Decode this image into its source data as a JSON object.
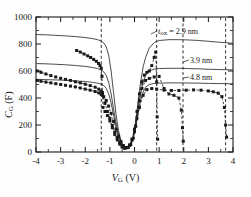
{
  "figure": {
    "kind": "cv-characteristic-plot",
    "background": "#ffffff",
    "frame_color": "#1a1a1a"
  },
  "axes": {
    "x": {
      "label_main": "V",
      "label_sub": "G",
      "label_unit": " (V)",
      "label_full": "V_G (V)",
      "min": -4,
      "max": 4,
      "major_ticks": [
        -4,
        -3,
        -2,
        -1,
        0,
        1,
        2,
        3,
        4
      ],
      "tick_labels": [
        "-4",
        "-3",
        "-2",
        "-1",
        "0",
        "1",
        "2",
        "3",
        "4"
      ],
      "minor_per_major": 2
    },
    "y": {
      "label_main": "C",
      "label_sub": "G",
      "label_unit": " (F)",
      "label_full": "C_G (F)",
      "min": 0,
      "max": 1000,
      "major_ticks": [
        0,
        200,
        400,
        600,
        800,
        1000
      ],
      "tick_labels": [
        "0",
        "200",
        "400",
        "600",
        "800",
        "1000"
      ],
      "minor_per_major": 2
    }
  },
  "annotations": [
    {
      "id": "tox-2-9",
      "text": "t",
      "sub": "ox",
      "eq": " = 2.9 nm",
      "value": 2.9,
      "unit": "nm",
      "full": "t_ox = 2.9 nm"
    },
    {
      "id": "tox-3-9",
      "text": "3.9 nm",
      "value": 3.9,
      "unit": "nm",
      "full": "3.9 nm"
    },
    {
      "id": "tox-4-8",
      "text": "4.8 nm",
      "value": 4.8,
      "unit": "nm",
      "full": "4.8 nm"
    }
  ],
  "chart_data": {
    "type": "line",
    "title": "",
    "xlabel": "V_G (V)",
    "ylabel": "C_G (F)",
    "xlim": [
      -4,
      4
    ],
    "ylim": [
      0,
      1000
    ],
    "grid": false,
    "legend_position": "inside-upper-right-annotations",
    "series": [
      {
        "name": "t_ox = 2.9 nm (model)",
        "style": "solid-line",
        "color": "#2b2b2b",
        "x": [
          -4.0,
          -3.6,
          -3.2,
          -2.8,
          -2.4,
          -2.0,
          -1.7,
          -1.5,
          -1.35,
          -1.25,
          -1.15,
          -1.05,
          -0.95,
          -0.85,
          -0.75,
          -0.65,
          -0.55,
          -0.45,
          -0.35,
          -0.25,
          -0.15,
          -0.05,
          0.05,
          0.15,
          0.25,
          0.35,
          0.45,
          0.6,
          0.8,
          1.0,
          1.4,
          1.8,
          2.2,
          2.6,
          3.0,
          3.4,
          3.8,
          4.0
        ],
        "y": [
          870,
          868,
          864,
          860,
          855,
          848,
          840,
          832,
          822,
          808,
          780,
          720,
          600,
          440,
          280,
          160,
          85,
          45,
          30,
          35,
          60,
          120,
          230,
          380,
          520,
          630,
          700,
          770,
          810,
          826,
          832,
          832,
          830,
          826,
          820,
          814,
          808,
          805
        ]
      },
      {
        "name": "t_ox = 3.9 nm (model)",
        "style": "solid-line",
        "color": "#2b2b2b",
        "x": [
          -4.0,
          -3.6,
          -3.2,
          -2.8,
          -2.4,
          -2.0,
          -1.7,
          -1.5,
          -1.35,
          -1.25,
          -1.15,
          -1.05,
          -0.95,
          -0.85,
          -0.75,
          -0.65,
          -0.55,
          -0.45,
          -0.35,
          -0.25,
          -0.15,
          -0.05,
          0.05,
          0.15,
          0.25,
          0.35,
          0.45,
          0.6,
          0.8,
          1.0,
          1.4,
          1.8,
          2.2,
          2.6,
          3.0,
          3.4,
          3.8,
          4.0
        ],
        "y": [
          655,
          653,
          650,
          646,
          641,
          634,
          626,
          618,
          608,
          594,
          568,
          516,
          430,
          320,
          215,
          132,
          74,
          42,
          30,
          35,
          58,
          112,
          205,
          330,
          440,
          520,
          566,
          600,
          614,
          618,
          620,
          620,
          618,
          616,
          613,
          611,
          609,
          608
        ]
      },
      {
        "name": "t_ox = 4.8 nm (model)",
        "style": "solid-line",
        "color": "#2b2b2b",
        "x": [
          -4.0,
          -3.6,
          -3.2,
          -2.8,
          -2.4,
          -2.0,
          -1.7,
          -1.5,
          -1.35,
          -1.25,
          -1.15,
          -1.05,
          -0.95,
          -0.85,
          -0.75,
          -0.65,
          -0.55,
          -0.45,
          -0.35,
          -0.25,
          -0.15,
          -0.05,
          0.05,
          0.15,
          0.25,
          0.35,
          0.45,
          0.6,
          0.8,
          1.0,
          1.4,
          1.8,
          2.2,
          2.6,
          3.0,
          3.4,
          3.8,
          4.0
        ],
        "y": [
          538,
          536,
          534,
          531,
          527,
          522,
          516,
          510,
          503,
          492,
          472,
          432,
          364,
          274,
          188,
          116,
          66,
          38,
          28,
          33,
          54,
          102,
          184,
          292,
          384,
          444,
          480,
          500,
          508,
          510,
          512,
          512,
          511,
          510,
          508,
          507,
          506,
          505
        ]
      },
      {
        "name": "measured t_ox = 2.9 nm",
        "style": "markers-dashed",
        "marker": "square",
        "color": "#1a1a1a",
        "x": [
          -2.35,
          -2.2,
          -2.05,
          -1.9,
          -1.78,
          -1.66,
          -1.55,
          -1.46,
          -1.4,
          -1.35,
          -1.32,
          -1.3,
          -1.28,
          -1.2,
          -1.1,
          -1.0,
          -0.9,
          -0.8,
          -0.7,
          -0.6,
          -0.5,
          -0.4,
          -0.3,
          -0.2,
          -0.1,
          0.0,
          0.1,
          0.2,
          0.3,
          0.4,
          0.5,
          0.6,
          0.7,
          0.8,
          0.86,
          0.9,
          0.92,
          0.94
        ],
        "y": [
          752,
          740,
          726,
          712,
          700,
          686,
          672,
          656,
          640,
          620,
          560,
          440,
          330,
          300,
          270,
          230,
          180,
          130,
          90,
          58,
          36,
          28,
          34,
          52,
          96,
          170,
          300,
          430,
          520,
          570,
          590,
          600,
          640,
          700,
          740,
          520,
          260,
          95
        ]
      },
      {
        "name": "measured t_ox = 3.9 nm",
        "style": "markers-dashed",
        "marker": "square",
        "color": "#1a1a1a",
        "x": [
          -3.95,
          -3.8,
          -3.6,
          -3.4,
          -3.2,
          -3.0,
          -2.8,
          -2.6,
          -2.4,
          -2.2,
          -2.0,
          -1.8,
          -1.6,
          -1.45,
          -1.35,
          -1.3,
          -1.2,
          -1.1,
          -1.0,
          -0.9,
          -0.8,
          -0.7,
          -0.6,
          -0.5,
          -0.4,
          -0.3,
          -0.2,
          -0.1,
          0.0,
          0.1,
          0.2,
          0.3,
          0.45,
          0.6,
          0.8,
          1.0,
          1.2,
          1.4,
          1.6,
          1.8,
          1.9,
          1.95,
          1.98
        ],
        "y": [
          600,
          590,
          578,
          566,
          556,
          546,
          538,
          530,
          520,
          512,
          502,
          492,
          480,
          466,
          450,
          420,
          360,
          300,
          250,
          196,
          146,
          104,
          70,
          44,
          30,
          32,
          50,
          88,
          150,
          250,
          380,
          470,
          530,
          545,
          556,
          560,
          470,
          430,
          420,
          400,
          310,
          180,
          80
        ]
      },
      {
        "name": "measured t_ox = 4.8 nm",
        "style": "markers-dashed",
        "marker": "square",
        "color": "#1a1a1a",
        "x": [
          -3.95,
          -3.8,
          -3.6,
          -3.4,
          -3.2,
          -3.0,
          -2.8,
          -2.6,
          -2.4,
          -2.2,
          -2.0,
          -1.8,
          -1.6,
          -1.45,
          -1.35,
          -1.25,
          -1.15,
          -1.05,
          -0.95,
          -0.85,
          -0.75,
          -0.65,
          -0.55,
          -0.45,
          -0.35,
          -0.25,
          -0.15,
          -0.05,
          0.05,
          0.2,
          0.35,
          0.5,
          0.7,
          0.9,
          1.2,
          1.5,
          1.8,
          2.1,
          2.4,
          2.7,
          3.0,
          3.2,
          3.4,
          3.55,
          3.65,
          3.7,
          3.74
        ],
        "y": [
          530,
          524,
          518,
          512,
          506,
          500,
          494,
          488,
          482,
          474,
          466,
          458,
          448,
          438,
          426,
          410,
          382,
          340,
          286,
          226,
          168,
          118,
          78,
          48,
          32,
          34,
          54,
          102,
          190,
          330,
          420,
          462,
          470,
          466,
          458,
          456,
          456,
          458,
          460,
          458,
          452,
          446,
          436,
          410,
          330,
          200,
          110
        ]
      }
    ],
    "breakdown_lines": [
      {
        "name": "breakdown-left",
        "x": -1.35,
        "style": "dashed"
      },
      {
        "name": "breakdown-2-9nm",
        "x": 0.9,
        "style": "dashed"
      },
      {
        "name": "breakdown-3-9nm",
        "x": 1.97,
        "style": "dashed"
      },
      {
        "name": "breakdown-4-8nm",
        "x": 3.7,
        "style": "dashed"
      }
    ]
  }
}
